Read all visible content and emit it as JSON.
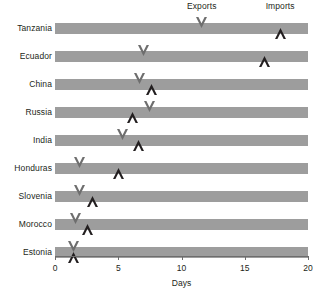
{
  "chart_data": {
    "type": "bar",
    "title": "",
    "xlabel": "Days",
    "ylabel": "",
    "xlim": [
      0,
      20
    ],
    "xticks": [
      0,
      5,
      10,
      15,
      20
    ],
    "xtick_labels": [
      "0",
      "5",
      "10",
      "15",
      "20"
    ],
    "grid": false,
    "legend_position": "top",
    "categories": [
      "Tanzania",
      "Ecuador",
      "China",
      "Russia",
      "India",
      "Honduras",
      "Slovenia",
      "Morocco",
      "Estonia"
    ],
    "series": [
      {
        "name": "Exports",
        "marker": "chevron-down",
        "color": "#6e6e6e",
        "values": [
          11.6,
          7.0,
          6.7,
          7.5,
          5.3,
          1.9,
          1.9,
          1.6,
          1.5
        ]
      },
      {
        "name": "Imports",
        "marker": "chevron-up",
        "color": "#231f20",
        "values": [
          17.8,
          16.6,
          7.6,
          6.1,
          6.6,
          5.0,
          3.0,
          2.6,
          1.5
        ]
      }
    ],
    "bar_color": "#9d9d9d",
    "bar_value": 20,
    "axis_color": "#6d6d6d"
  },
  "legend": {
    "exports_label": "Exports",
    "imports_label": "Imports",
    "exports_anchor_value": 11.6,
    "imports_anchor_value": 17.8
  }
}
